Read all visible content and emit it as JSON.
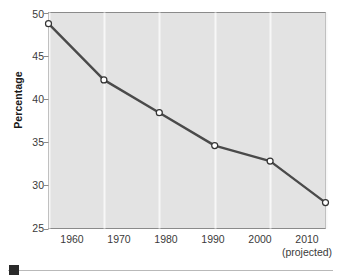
{
  "chart_data": {
    "type": "line",
    "title": "",
    "subtitle": "",
    "xlabel": "",
    "ylabel": "Percentage",
    "x": [
      1960,
      1970,
      1980,
      1990,
      2000,
      2010
    ],
    "categories": [
      "1960",
      "1970",
      "1980",
      "1990",
      "2000",
      "2010"
    ],
    "values": [
      48.7,
      42.2,
      38.4,
      34.6,
      32.8,
      28.0
    ],
    "point_labels": [
      "48.7",
      "42.2",
      "38.4",
      "34.6",
      "32.8",
      "28.0"
    ],
    "series": [
      {
        "name": "Percentage",
        "values": [
          48.7,
          42.2,
          38.4,
          34.6,
          32.8,
          28.0
        ]
      }
    ],
    "ylim": [
      25,
      50
    ],
    "xlim": [
      1960,
      2010
    ],
    "ytick_labels": [
      "25",
      "30",
      "35",
      "40",
      "45",
      "50"
    ],
    "ytick_values": [
      25,
      30,
      35,
      40,
      45,
      50
    ],
    "xtick_labels": [
      "1960",
      "1970",
      "1980",
      "1990",
      "2000",
      "2010"
    ],
    "xtick_note": "(projected)",
    "grid": "vertical-only",
    "legend": "none",
    "marker": "open-circle",
    "colors": {
      "plot_background": "#e3e3e3",
      "gridline": "#f7f7f7",
      "line": "#4a4a4a",
      "marker_fill": "#ffffff",
      "marker_edge": "#333333",
      "axis": "#8a8a8a",
      "text": "#3a3a3a",
      "footer_marker": "#2a2a2a",
      "footer_rule": "#b9b9b9"
    }
  },
  "axes": {
    "y_title": "Percentage",
    "y_ticks": [
      "50",
      "45",
      "40",
      "35",
      "30",
      "25"
    ],
    "x_ticks": [
      "1960",
      "1970",
      "1980",
      "1990",
      "2000",
      "2010"
    ],
    "x_note": "(projected)"
  },
  "labels": {
    "p0": "48.7",
    "p1": "42.2",
    "p2": "38.4",
    "p3": "34.6",
    "p4": "32.8",
    "p5": "28.0"
  },
  "footer": {
    "marker": "black-square-icon"
  }
}
